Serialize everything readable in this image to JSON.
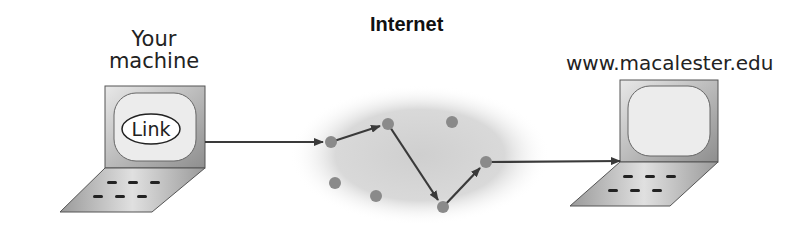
{
  "diagram": {
    "title": "Internet",
    "client": {
      "label_line1": "Your",
      "label_line2": "machine",
      "screen_text": "Link"
    },
    "server": {
      "label": "www.macalester.edu"
    },
    "nodes": [
      {
        "x": 331,
        "y": 142
      },
      {
        "x": 388,
        "y": 124
      },
      {
        "x": 452,
        "y": 122
      },
      {
        "x": 335,
        "y": 183
      },
      {
        "x": 376,
        "y": 196
      },
      {
        "x": 443,
        "y": 207
      },
      {
        "x": 486,
        "y": 162
      }
    ],
    "route": [
      "client",
      "node0",
      "node1",
      "node5",
      "node6",
      "server"
    ],
    "colors": {
      "node": "#8a8a8a",
      "cloud": "#d6d6d6",
      "arrow": "#3a3a3a",
      "device": "#a8a8a8"
    }
  }
}
